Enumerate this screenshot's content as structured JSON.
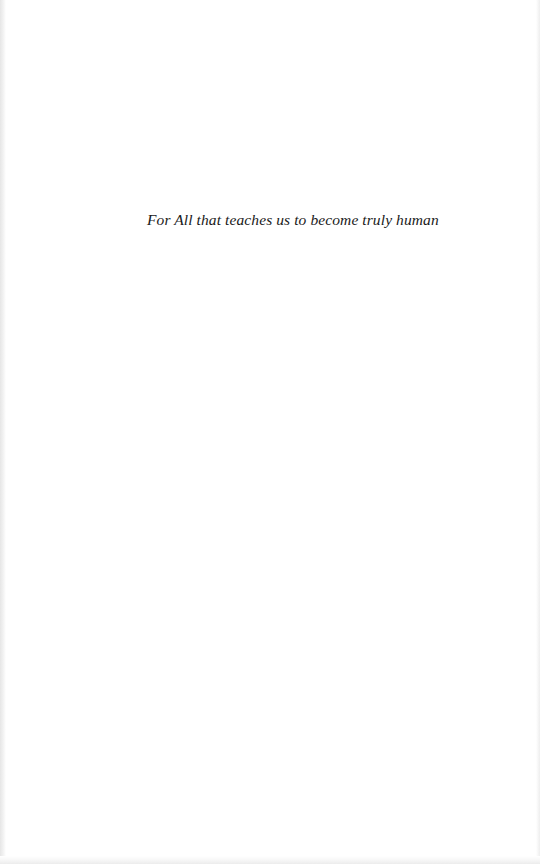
{
  "page": {
    "background": "#ffffff",
    "dedication": "For All that teaches us to become truly human"
  }
}
